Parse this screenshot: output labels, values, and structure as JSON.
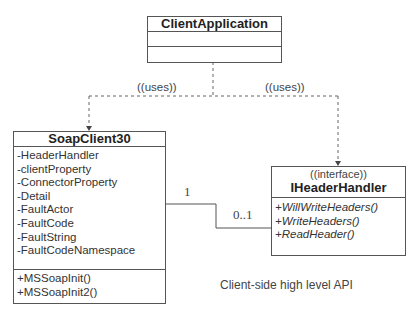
{
  "diagram": {
    "caption": "Client-side high level API",
    "classes": {
      "client_application": {
        "name": "ClientApplication",
        "attributes": [],
        "methods": []
      },
      "soap_client": {
        "name": "SoapClient30",
        "attributes": [
          "-HeaderHandler",
          "-clientProperty",
          "-ConnectorProperty",
          "-Detail",
          "-FaultActor",
          "-FaultCode",
          "-FaultString",
          "-FaultCodeNamespace"
        ],
        "methods": [
          "+MSSoapInit()",
          "+MSSoapInit2()"
        ]
      },
      "header_handler": {
        "stereotype": "((interface))",
        "name": "IHeaderHandler",
        "methods": [
          "+WillWriteHeaders()",
          "+WriteHeaders()",
          "+ReadHeader()"
        ]
      }
    },
    "relations": {
      "uses_left": "((uses))",
      "uses_right": "((uses))",
      "assoc_mult_source": "1",
      "assoc_mult_target": "0..1"
    },
    "colors": {
      "line": "#555555",
      "text": "#333333"
    }
  }
}
